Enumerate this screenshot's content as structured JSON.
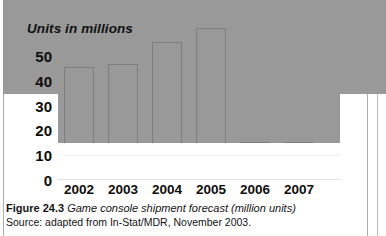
{
  "chart_data": {
    "type": "bar",
    "title": "Units in millions",
    "xlabel": "",
    "ylabel": "Units in millions",
    "categories": [
      "2002",
      "2003",
      "2004",
      "2005",
      "2006",
      "2007"
    ],
    "values": [
      41,
      38,
      33,
      34.5,
      44,
      50
    ],
    "yticks": [
      50,
      40,
      30,
      20,
      10,
      0
    ],
    "ylim": [
      0,
      54
    ],
    "grid": true,
    "legend": "none",
    "series": [
      {
        "name": "Game console shipments",
        "values": [
          41,
          38,
          33,
          34.5,
          44,
          50
        ]
      }
    ],
    "bar_color": "#999999",
    "bar_border_color": "#7e7e7e",
    "gridline_color": "#f0f0f0"
  },
  "figure": {
    "caption_number": "Figure 24.3",
    "caption_description": "Game console shipment forecast (million units)",
    "source": "Source: adapted from In-Stat/MDR, November 2003."
  }
}
